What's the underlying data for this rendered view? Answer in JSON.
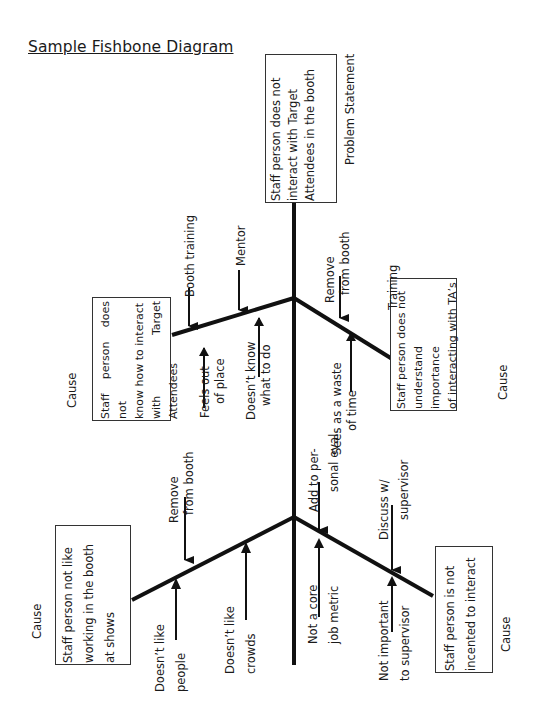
{
  "title": "Sample Fishbone Diagram",
  "problem": {
    "label": "Problem Statement",
    "lines": [
      "Staff person does not",
      "interact with Target",
      "Attendees in the booth"
    ]
  },
  "causes": {
    "upper_left": {
      "label": "Cause",
      "lines": [
        "Staff person does not",
        "know how to interact",
        "with Target Attendees"
      ],
      "solutions": [
        "Booth training",
        "Mentor"
      ],
      "reasons": [
        [
          "Feels out",
          "of place"
        ],
        [
          "Doesn’t know",
          "what to do"
        ]
      ]
    },
    "upper_right": {
      "label": "Cause",
      "lines": [
        "Staff person does not",
        "understand importance",
        "of interacting with TA’s"
      ],
      "solutions": [
        [
          "Remove",
          "from booth"
        ],
        "Training"
      ],
      "reasons": [
        [
          "Sees as a waste",
          "of time"
        ]
      ]
    },
    "lower_left": {
      "label": "Cause",
      "lines": [
        "Staff person not like",
        "working in the booth",
        "at shows"
      ],
      "solutions": [
        [
          "Remove",
          "from booth"
        ]
      ],
      "reasons": [
        [
          "Doesn’t like",
          "people"
        ],
        [
          "Doesn’t like",
          "crowds"
        ]
      ]
    },
    "lower_right": {
      "label": "Cause",
      "lines": [
        "Staff person is not",
        "incented to interact"
      ],
      "solutions": [
        [
          "Add to per-",
          "sonal eval."
        ],
        [
          "Discuss w/",
          "supervisor"
        ]
      ],
      "reasons": [
        [
          "Not a core",
          "job metric"
        ],
        [
          "Not important",
          "to supervisor"
        ]
      ]
    }
  },
  "colors": {
    "line": "#111111",
    "box_border": "#333333",
    "text": "#1a1a1a",
    "background": "#ffffff"
  }
}
